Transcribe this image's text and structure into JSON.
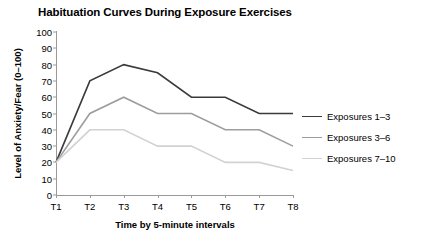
{
  "chart_data": {
    "type": "line",
    "title": "Habituation Curves During Exposure Exercises",
    "xlabel": "Time by 5-minute intervals",
    "ylabel": "Level of Anxiety/Fear (0–100)",
    "categories": [
      "T1",
      "T2",
      "T3",
      "T4",
      "T5",
      "T6",
      "T7",
      "T8"
    ],
    "ylim": [
      0,
      100
    ],
    "yticks": [
      0,
      10,
      20,
      30,
      40,
      50,
      60,
      70,
      80,
      90,
      100
    ],
    "grid": false,
    "legend_position": "right",
    "series": [
      {
        "name": "Exposures 1–3",
        "color": "#3a3a3a",
        "width": 1.6,
        "values": [
          20,
          70,
          80,
          75,
          60,
          60,
          50,
          50
        ]
      },
      {
        "name": "Exposures 3–6",
        "color": "#9d9d9d",
        "width": 1.6,
        "values": [
          20,
          50,
          60,
          50,
          50,
          40,
          40,
          30
        ]
      },
      {
        "name": "Exposures 7–10",
        "color": "#d2d2d2",
        "width": 1.6,
        "values": [
          20,
          40,
          40,
          30,
          30,
          20,
          20,
          15
        ]
      }
    ]
  }
}
